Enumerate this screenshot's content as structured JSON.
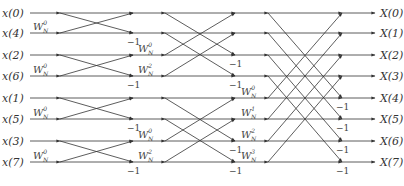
{
  "inputs": [
    "x(0)",
    "x(4)",
    "x(2)",
    "x(6)",
    "x(1)",
    "x(5)",
    "x(3)",
    "x(7)"
  ],
  "outputs": [
    "X(0)",
    "X(1)",
    "X(2)",
    "X(3)",
    "X(4)",
    "X(5)",
    "X(6)",
    "X(7)"
  ],
  "row_y": [
    13,
    33,
    55,
    76,
    98,
    119,
    141,
    162
  ],
  "columns": {
    "in_label_x": 2,
    "in_start": 30,
    "n0": 60,
    "n1": 133,
    "n2": 165,
    "n3": 235,
    "n4": 268,
    "n5": 342,
    "out_end": 375,
    "out_label_x": 380
  },
  "stage1": {
    "span": 1,
    "twiddles": [
      {
        "row": 1,
        "label": "W",
        "sub": "N",
        "sup": "0"
      },
      {
        "row": 3,
        "label": "W",
        "sub": "N",
        "sup": "0"
      },
      {
        "row": 5,
        "label": "W",
        "sub": "N",
        "sup": "0"
      },
      {
        "row": 7,
        "label": "W",
        "sub": "N",
        "sup": "0"
      }
    ]
  },
  "stage2": {
    "span": 2,
    "twiddles": [
      {
        "row": 2,
        "label": "W",
        "sub": "N",
        "sup": "0"
      },
      {
        "row": 3,
        "label": "W",
        "sub": "N",
        "sup": "2"
      },
      {
        "row": 6,
        "label": "W",
        "sub": "N",
        "sup": "0"
      },
      {
        "row": 7,
        "label": "W",
        "sub": "N",
        "sup": "2"
      }
    ]
  },
  "stage3": {
    "span": 4,
    "twiddles": [
      {
        "row": 4,
        "label": "W",
        "sub": "N",
        "sup": "0"
      },
      {
        "row": 5,
        "label": "W",
        "sub": "N",
        "sup": "1"
      },
      {
        "row": 6,
        "label": "W",
        "sub": "N",
        "sup": "2"
      },
      {
        "row": 7,
        "label": "W",
        "sub": "N",
        "sup": "3"
      }
    ]
  },
  "minus_one": "−1",
  "colors": {
    "line": "#333333",
    "text": "#333333",
    "background": "#ffffff"
  }
}
